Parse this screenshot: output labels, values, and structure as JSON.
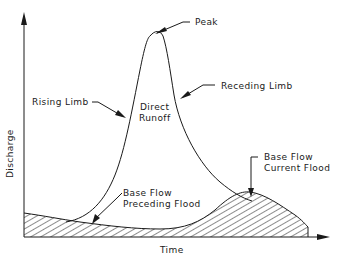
{
  "diagram": {
    "type": "hydrograph",
    "axes": {
      "x_label": "Time",
      "y_label": "Discharge"
    },
    "labels": {
      "peak": "Peak",
      "rising_limb": "Rising Limb",
      "receding_limb": "Receding Limb",
      "direct_runoff_line1": "Direct",
      "direct_runoff_line2": "Runoff",
      "base_flow_preceding_line1": "Base Flow",
      "base_flow_preceding_line2": "Preceding Flood",
      "base_flow_current_line1": "Base Flow",
      "base_flow_current_line2": "Current Flood"
    },
    "colors": {
      "line": "#1a1a1a",
      "background": "#ffffff"
    }
  }
}
